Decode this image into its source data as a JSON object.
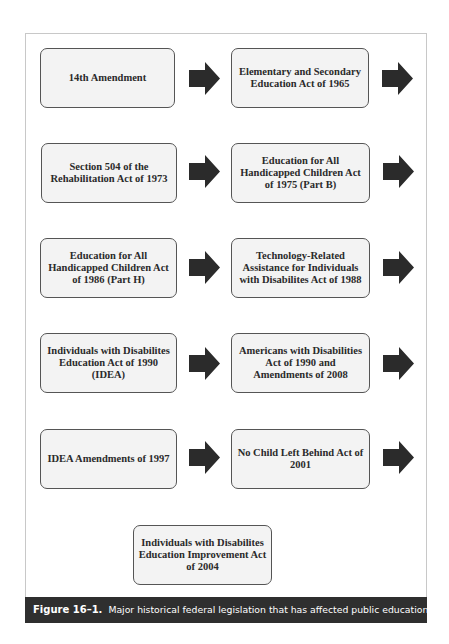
{
  "diagram": {
    "boxes": [
      {
        "label": "14th Amendment"
      },
      {
        "label": "Elementary and Secondary\nEducation Act of 1965"
      },
      {
        "label": "Section 504 of the\nRehabilitation Act of 1973"
      },
      {
        "label": "Education for All\nHandicapped Children Act\nof 1975 (Part B)"
      },
      {
        "label": "Education for All\nHandicapped Children Act\nof 1986 (Part H)"
      },
      {
        "label": "Technology-Related\nAssistance for Individuals\nwith Disabilites Act of 1988"
      },
      {
        "label": "Individuals with Disabilites\nEducation Act of 1990\n(IDEA)"
      },
      {
        "label": "Americans with Disabilities\nAct of 1990 and\nAmendments of 2008"
      },
      {
        "label": "IDEA Amendments of 1997"
      },
      {
        "label": "No Child Left Behind Act of\n2001"
      },
      {
        "label": "Individuals with Disabilites\nEducation Improvement Act\nof 2004"
      }
    ],
    "arrow_icon": "right-arrow-icon",
    "colors": {
      "box_fill": "#f3f3f3",
      "box_border": "#555555",
      "arrow": "#2b2b2b",
      "caption_bg": "#2f2f2f"
    }
  },
  "caption": {
    "label": "Figure 16–1.",
    "text": "Major historical federal legislation that has affected public education."
  }
}
